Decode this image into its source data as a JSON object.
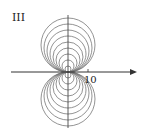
{
  "panel_label": "III",
  "x_tick_label": "10",
  "colors": {
    "circles": "#777777",
    "axes": "#333333",
    "text": "#222222"
  },
  "chart_data": {
    "type": "diagram",
    "title": "III",
    "axes": {
      "x_tick": 10,
      "x_arrow": true,
      "y_axis": true
    },
    "circle_families": [
      {
        "side": "above",
        "radii_px": [
          3,
          6,
          9,
          12,
          15,
          18,
          21,
          24,
          27
        ]
      },
      {
        "side": "below",
        "radii_px": [
          3,
          6,
          9,
          12,
          15,
          18,
          21,
          24,
          27
        ]
      }
    ]
  }
}
